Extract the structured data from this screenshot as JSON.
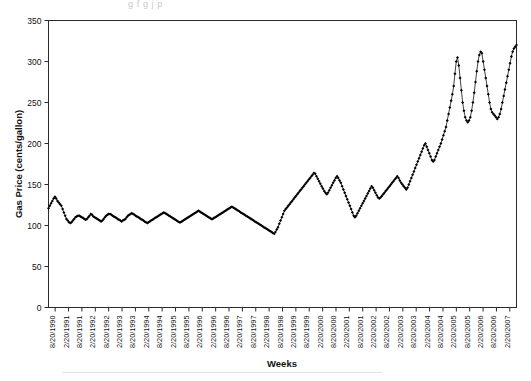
{
  "figure": {
    "caption_sliver": "g  f     g        j        p",
    "alt_name": "weekly-gas-price-line-chart"
  },
  "chart_data": {
    "type": "line",
    "title": "",
    "subtitle": "",
    "xlabel": "Weeks",
    "ylabel": "Gas Price (cents/gallon)",
    "ylim": [
      0,
      350
    ],
    "ytick_step": 50,
    "yticks": [
      0,
      50,
      100,
      150,
      200,
      250,
      300,
      350
    ],
    "grid": false,
    "legend": null,
    "legend_position": "none",
    "marker": "diamond",
    "marker_color": "#000000",
    "line_color": "#000000",
    "frame": true,
    "x_tick_labels": [
      "8/20/1990",
      "2/20/1991",
      "8/20/1991",
      "2/20/1992",
      "8/20/1992",
      "2/20/1993",
      "8/20/1993",
      "2/20/1994",
      "8/20/1994",
      "2/20/1995",
      "8/20/1995",
      "2/20/1996",
      "2/20/1996",
      "8/20/1996",
      "2/20/1997",
      "8/20/1997",
      "2/20/1998",
      "8/20/1998",
      "2/20/1999",
      "8/20/1999",
      "2/20/2000",
      "8/20/2000",
      "2/20/2001",
      "8/20/2001",
      "2/20/2002",
      "8/20/2002",
      "2/20/2003",
      "8/20/2003",
      "2/20/2004",
      "8/20/2004",
      "2/20/2005",
      "8/20/2005",
      "2/20/2006",
      "8/20/2006",
      "2/20/2007"
    ],
    "x_axis_start": "8/20/1990",
    "x_axis_end": "2/20/2007",
    "x_tick_interval": "6 months",
    "x_tick_count": 34,
    "series": [
      {
        "name": "Gas Price",
        "unit": "cents/gallon",
        "sample_interval": "weekly",
        "values": [
          121,
          124,
          127,
          130,
          133,
          135,
          133,
          130,
          128,
          126,
          124,
          120,
          116,
          112,
          108,
          106,
          104,
          103,
          104,
          106,
          108,
          110,
          111,
          112,
          112,
          111,
          110,
          109,
          108,
          107,
          108,
          110,
          112,
          114,
          113,
          111,
          110,
          109,
          108,
          107,
          106,
          105,
          106,
          108,
          110,
          112,
          113,
          114,
          114,
          113,
          112,
          111,
          110,
          109,
          108,
          107,
          106,
          105,
          106,
          107,
          108,
          110,
          112,
          113,
          114,
          115,
          114,
          113,
          112,
          111,
          110,
          109,
          108,
          107,
          106,
          105,
          104,
          103,
          104,
          105,
          106,
          107,
          108,
          109,
          110,
          111,
          112,
          113,
          114,
          115,
          116,
          115,
          114,
          113,
          112,
          111,
          110,
          109,
          108,
          107,
          106,
          105,
          104,
          104,
          105,
          106,
          107,
          108,
          109,
          110,
          111,
          112,
          113,
          114,
          115,
          116,
          117,
          118,
          117,
          116,
          115,
          114,
          113,
          112,
          111,
          110,
          109,
          108,
          108,
          109,
          110,
          111,
          112,
          113,
          114,
          115,
          116,
          117,
          118,
          119,
          120,
          121,
          122,
          123,
          122,
          121,
          120,
          119,
          118,
          117,
          116,
          115,
          114,
          113,
          112,
          111,
          110,
          109,
          108,
          107,
          106,
          105,
          104,
          103,
          102,
          101,
          100,
          99,
          98,
          97,
          96,
          95,
          94,
          93,
          92,
          91,
          90,
          92,
          95,
          98,
          102,
          106,
          110,
          114,
          118,
          120,
          122,
          124,
          126,
          128,
          130,
          132,
          134,
          136,
          138,
          140,
          142,
          144,
          146,
          148,
          150,
          152,
          154,
          156,
          158,
          160,
          162,
          164,
          163,
          160,
          157,
          154,
          151,
          148,
          145,
          142,
          140,
          138,
          140,
          143,
          146,
          149,
          152,
          155,
          158,
          160,
          158,
          155,
          152,
          148,
          144,
          140,
          136,
          132,
          128,
          124,
          120,
          116,
          112,
          110,
          112,
          115,
          118,
          121,
          124,
          127,
          130,
          133,
          136,
          139,
          142,
          145,
          148,
          146,
          143,
          140,
          137,
          134,
          133,
          134,
          136,
          138,
          140,
          142,
          144,
          146,
          148,
          150,
          152,
          154,
          156,
          158,
          160,
          158,
          155,
          152,
          150,
          148,
          146,
          144,
          146,
          150,
          154,
          158,
          162,
          166,
          170,
          174,
          178,
          182,
          186,
          190,
          194,
          198,
          200,
          196,
          192,
          188,
          184,
          180,
          178,
          180,
          184,
          188,
          192,
          196,
          200,
          205,
          210,
          215,
          220,
          228,
          236,
          244,
          252,
          260,
          270,
          285,
          300,
          305,
          295,
          280,
          265,
          250,
          240,
          232,
          228,
          226,
          228,
          232,
          240,
          250,
          262,
          275,
          288,
          300,
          308,
          312,
          310,
          300,
          290,
          280,
          270,
          260,
          250,
          242,
          238,
          236,
          234,
          232,
          230,
          232,
          236,
          242,
          250,
          258,
          266,
          274,
          282,
          290,
          298,
          306,
          312,
          316,
          318,
          320
        ]
      }
    ]
  },
  "axes": {
    "y_axis_title": "Gas Price (cents/gallon)",
    "x_axis_title": "Weeks"
  }
}
